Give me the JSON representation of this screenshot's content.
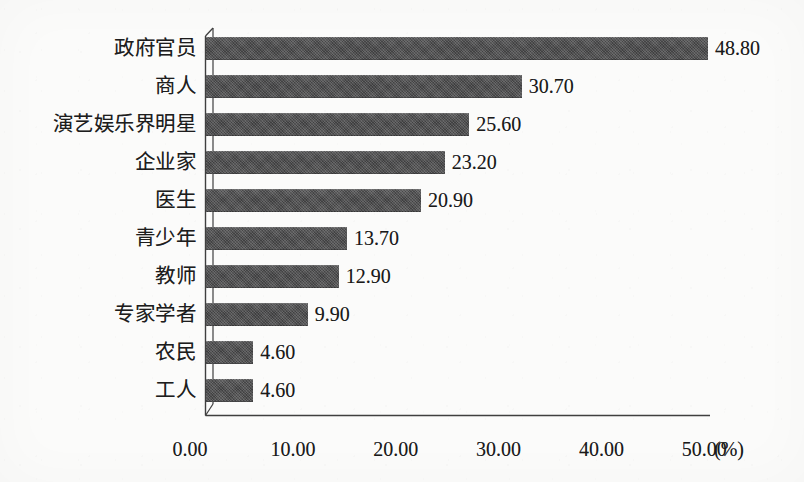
{
  "chart_data": {
    "type": "bar",
    "orientation": "horizontal",
    "title": "",
    "xlabel": "(%)",
    "ylabel": "",
    "xlim": [
      0,
      50
    ],
    "grid": false,
    "legend": null,
    "categories": [
      "政府官员",
      "商人",
      "演艺娱乐界明星",
      "企业家",
      "医生",
      "青少年",
      "教师",
      "专家学者",
      "农民",
      "工人"
    ],
    "values": [
      48.8,
      30.7,
      25.6,
      23.2,
      20.9,
      13.7,
      12.9,
      9.9,
      4.6,
      4.6
    ],
    "value_labels": [
      "48.80",
      "30.70",
      "25.60",
      "23.20",
      "20.90",
      "13.70",
      "12.90",
      "9.90",
      "4.60",
      "4.60"
    ],
    "x_ticks": [
      0,
      10,
      20,
      30,
      40,
      50
    ],
    "x_tick_labels": [
      "0.00",
      "10.00",
      "20.00",
      "30.00",
      "40.00",
      "50.00"
    ],
    "unit_label": "(%)",
    "colors": {
      "bar": "#4b4b4c",
      "axis": "#3a3a3a",
      "text": "#1a1a1a",
      "background": "#fbfbfa"
    }
  },
  "axis": {
    "unit": "(%)"
  }
}
